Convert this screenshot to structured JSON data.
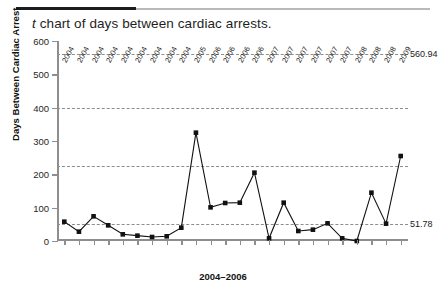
{
  "header": {
    "rule": "horizontal-rule"
  },
  "title": {
    "variable": "t",
    "rest": " chart of days between cardiac arrests."
  },
  "axes": {
    "y_title": "Days Between Cardiac Arrest",
    "x_title": "2004–2006",
    "y_ticks": [
      "600",
      "500",
      "400",
      "300",
      "200",
      "100",
      "0"
    ]
  },
  "reference_lines": [
    {
      "label": "560.94",
      "value": 560.94,
      "name": "upper-control-limit"
    },
    {
      "label": "",
      "value": 400.0,
      "name": "reference-line-400"
    },
    {
      "label": "",
      "value": 225.0,
      "name": "reference-line-225"
    },
    {
      "label": "51.78",
      "value": 51.78,
      "name": "lower-control-limit"
    }
  ],
  "chart_data": {
    "type": "line",
    "title": "t chart of days between cardiac arrests.",
    "xlabel": "2004–2006",
    "ylabel": "Days Between Cardiac Arrest",
    "ylim": [
      0,
      600
    ],
    "yticks": [
      0,
      100,
      200,
      300,
      400,
      500,
      600
    ],
    "grid": false,
    "legend": "none",
    "marker": "filled-square",
    "color": "#111111",
    "categories": [
      "2004",
      "2004",
      "2004",
      "2004",
      "2004",
      "2004",
      "2004",
      "2004",
      "2004",
      "2005",
      "2006",
      "2006",
      "2006",
      "2006",
      "2007",
      "2007",
      "2007",
      "2007",
      "2007",
      "2007",
      "2008",
      "2008",
      "2008",
      "2008",
      "2009"
    ],
    "x": [
      1,
      2,
      3,
      4,
      5,
      6,
      7,
      8,
      9,
      10,
      11,
      12,
      13,
      14,
      15,
      16,
      17,
      18,
      19,
      20,
      21,
      22,
      23,
      24,
      25
    ],
    "values": [
      58,
      28,
      74,
      47,
      20,
      16,
      12,
      14,
      40,
      325,
      101,
      114,
      115,
      205,
      8,
      115,
      30,
      34,
      53,
      8,
      0,
      145,
      52,
      255,
      255
    ],
    "annotations": [
      {
        "text": "560.94",
        "y": 560.94,
        "position": "right"
      },
      {
        "text": "51.78",
        "y": 51.78,
        "position": "right"
      }
    ],
    "control_limits": {
      "ucl": 560.94,
      "lcl": 51.78
    },
    "reference_values": [
      560.94,
      400.0,
      225.0,
      51.78
    ]
  },
  "x_tick_labels": [
    "2004",
    "2004",
    "2004",
    "2004",
    "2004",
    "2004",
    "2004",
    "2004",
    "2004",
    "2005",
    "2006",
    "2006",
    "2006",
    "2006",
    "2007",
    "2007",
    "2007",
    "2007",
    "2007",
    "2007",
    "2008",
    "2008",
    "2008",
    "2009"
  ],
  "series_points": [
    {
      "i": 0,
      "v": 58
    },
    {
      "i": 1,
      "v": 28
    },
    {
      "i": 2,
      "v": 74
    },
    {
      "i": 3,
      "v": 47
    },
    {
      "i": 4,
      "v": 20
    },
    {
      "i": 5,
      "v": 16
    },
    {
      "i": 6,
      "v": 12
    },
    {
      "i": 7,
      "v": 14
    },
    {
      "i": 8,
      "v": 40
    },
    {
      "i": 9,
      "v": 325
    },
    {
      "i": 10,
      "v": 101
    },
    {
      "i": 11,
      "v": 114
    },
    {
      "i": 12,
      "v": 115
    },
    {
      "i": 13,
      "v": 205
    },
    {
      "i": 14,
      "v": 8
    },
    {
      "i": 15,
      "v": 115
    },
    {
      "i": 16,
      "v": 30
    },
    {
      "i": 17,
      "v": 34
    },
    {
      "i": 18,
      "v": 53
    },
    {
      "i": 19,
      "v": 8
    },
    {
      "i": 20,
      "v": 0
    },
    {
      "i": 21,
      "v": 145
    },
    {
      "i": 22,
      "v": 52
    },
    {
      "i": 23,
      "v": 255
    }
  ]
}
